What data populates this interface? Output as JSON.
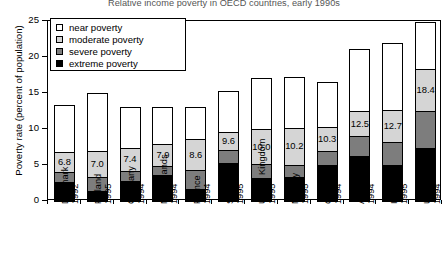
{
  "chart_data": {
    "type": "bar",
    "subtype": "stacked-bar",
    "title": "Relative income poverty in OECD countries, early 1990s",
    "xlabel": "",
    "ylabel": "Poverty rate (percent of population)",
    "ylim": [
      0,
      25
    ],
    "yticks": [
      0,
      5,
      10,
      15,
      20,
      25
    ],
    "grid": false,
    "legend_position": "upper-left-inside",
    "categories": [
      "Denmark 1992",
      "Finland 1995",
      "Germany 1994",
      "Netherlands 1994",
      "France 1994",
      "Sweden 1995",
      "United Kingdom 1995",
      "Norway 1995",
      "Canada 1994",
      "Australia 1994",
      "Italy 1995",
      "United States 1994"
    ],
    "category_countries": [
      "Denmark",
      "Finland",
      "Germany",
      "Netherlands",
      "France",
      "Sweden",
      "United Kingdom",
      "Norway",
      "Canada",
      "Australia",
      "Italy",
      "United States"
    ],
    "category_years": [
      "1992",
      "1995",
      "1994",
      "1994",
      "1994",
      "1995",
      "1995",
      "1995",
      "1994",
      "1994",
      "1995",
      "1994"
    ],
    "series": [
      {
        "name": "extreme poverty",
        "color": "#000000",
        "values": [
          2.6,
          1.4,
          2.8,
          3.6,
          1.6,
          5.3,
          3.2,
          3.4,
          5.0,
          6.3,
          5.0,
          7.3
        ]
      },
      {
        "name": "severe poverty",
        "color": "#7d7d7d",
        "values": [
          1.4,
          1.9,
          1.4,
          1.2,
          2.7,
          1.8,
          1.9,
          1.6,
          1.9,
          2.7,
          3.2,
          5.2
        ]
      },
      {
        "name": "moderate poverty",
        "color": "#d5d5d5",
        "values": [
          2.8,
          3.7,
          3.2,
          3.1,
          4.3,
          2.5,
          4.9,
          5.2,
          3.4,
          3.5,
          4.5,
          5.9
        ]
      },
      {
        "name": "near poverty",
        "color": "#ffffff",
        "values": [
          6.5,
          8.0,
          5.7,
          5.2,
          4.5,
          5.7,
          7.1,
          7.0,
          6.2,
          8.6,
          9.2,
          6.5
        ]
      }
    ],
    "cumulative_labels": [
      6.8,
      7.0,
      7.4,
      7.9,
      8.6,
      9.6,
      10.0,
      10.2,
      10.3,
      12.5,
      12.7,
      18.4
    ],
    "cumulative_label_meaning": "top of moderate poverty segment (extreme + severe + moderate)",
    "totals": [
      13.3,
      15.0,
      13.1,
      13.1,
      13.1,
      15.3,
      17.1,
      17.2,
      16.5,
      21.1,
      21.9,
      24.9
    ]
  },
  "legend": {
    "items": [
      {
        "label": "near poverty",
        "swatch": "#ffffff"
      },
      {
        "label": "moderate poverty",
        "swatch": "#d5d5d5"
      },
      {
        "label": "severe poverty",
        "swatch": "#7d7d7d"
      },
      {
        "label": "extreme poverty",
        "swatch": "#000000"
      }
    ]
  }
}
